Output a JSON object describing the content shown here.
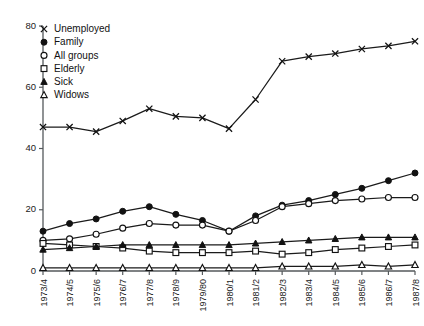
{
  "chart_data": {
    "type": "line",
    "title": "",
    "subtitle": "",
    "xlabel": "",
    "ylabel": "",
    "xlim": [
      0,
      14
    ],
    "ylim": [
      0,
      80
    ],
    "yticks": [
      0,
      20,
      40,
      60,
      80
    ],
    "grid": false,
    "legend_position": "top-left",
    "categories": [
      "1973/4",
      "1974/5",
      "1975/6",
      "1976/7",
      "1977/8",
      "1978/9",
      "1979/80",
      "1980/1",
      "1981/2",
      "1982/3",
      "1983/4",
      "1984/5",
      "1985/6",
      "1986/7",
      "1987/8"
    ],
    "series": [
      {
        "name": "Unemployed",
        "marker": "cross",
        "values": [
          47,
          47,
          45.5,
          49,
          53,
          50.5,
          50,
          46.5,
          56,
          68.5,
          70,
          71,
          72.5,
          73.5,
          75
        ]
      },
      {
        "name": "Family",
        "marker": "filled-circle",
        "values": [
          13,
          15.5,
          17,
          19.5,
          21,
          18.5,
          16.5,
          13,
          18,
          21.5,
          23,
          25,
          27,
          29.5,
          32
        ]
      },
      {
        "name": "All groups",
        "marker": "open-circle",
        "values": [
          10,
          10.5,
          12,
          14,
          15.5,
          15,
          15,
          13,
          16.5,
          21,
          22,
          23,
          23.5,
          24,
          24
        ]
      },
      {
        "name": "Elderly",
        "marker": "open-square",
        "values": [
          9,
          8.5,
          8,
          7.5,
          6.5,
          6,
          6,
          6,
          6.5,
          5.5,
          6,
          7,
          7.5,
          8,
          8.5
        ]
      },
      {
        "name": "Sick",
        "marker": "filled-triangle",
        "values": [
          7,
          7.5,
          8,
          8.5,
          8.5,
          8.5,
          8.5,
          8.5,
          9,
          9.5,
          10,
          10.5,
          11,
          11,
          11
        ]
      },
      {
        "name": "Widows",
        "marker": "open-triangle",
        "values": [
          1,
          1,
          1,
          1,
          1,
          1,
          1,
          1,
          1,
          1.5,
          1.5,
          1.5,
          2,
          1.5,
          2
        ]
      }
    ]
  },
  "legend": {
    "entries": [
      {
        "label": "Unemployed",
        "marker": "cross"
      },
      {
        "label": "Family",
        "marker": "filled-circle"
      },
      {
        "label": "All groups",
        "marker": "open-circle"
      },
      {
        "label": "Elderly",
        "marker": "open-square"
      },
      {
        "label": "Sick",
        "marker": "filled-triangle"
      },
      {
        "label": "Widows",
        "marker": "open-triangle"
      }
    ]
  },
  "colors": {
    "ink": "#121212",
    "axis": "#55595c",
    "background": "#ffffff"
  }
}
